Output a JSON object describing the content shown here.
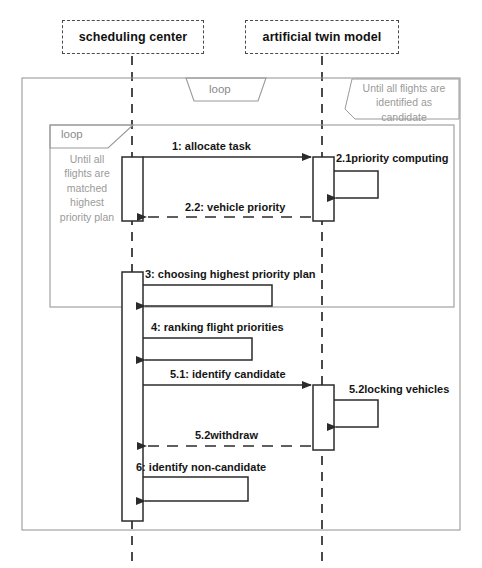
{
  "diagram": {
    "type": "uml-sequence-diagram",
    "title": "",
    "colors": {
      "line": "#3a3a3a",
      "frame": "#9a9a9a",
      "text": "#151515",
      "muted": "#9a9a9a",
      "background": "#ffffff"
    }
  },
  "participants": [
    {
      "id": "scheduling-center",
      "label": "scheduling center",
      "lifeline_x": 132
    },
    {
      "id": "artificial-twin-model",
      "label": "artificial twin model",
      "lifeline_x": 322
    }
  ],
  "fragments": [
    {
      "id": "outer-loop",
      "operator": "loop",
      "guard": "Until all flights are\nidentified as\ncandidate"
    },
    {
      "id": "inner-loop",
      "operator": "loop",
      "guard": "Until all\nflights are\nmatched\nhighest\npriority plan"
    }
  ],
  "messages": [
    {
      "seq": "1",
      "label": "1:  allocate task",
      "kind": "call",
      "from": "scheduling-center",
      "to": "artificial-twin-model"
    },
    {
      "seq": "2.1",
      "label": "2.1priority computing",
      "kind": "self",
      "from": "artificial-twin-model",
      "to": "artificial-twin-model"
    },
    {
      "seq": "2.2",
      "label": "2.2:  vehicle priority",
      "kind": "return",
      "from": "artificial-twin-model",
      "to": "scheduling-center"
    },
    {
      "seq": "3",
      "label": "3:  choosing highest priority plan",
      "kind": "self",
      "from": "scheduling-center",
      "to": "scheduling-center"
    },
    {
      "seq": "4",
      "label": "4:  ranking flight priorities",
      "kind": "self",
      "from": "scheduling-center",
      "to": "scheduling-center"
    },
    {
      "seq": "5.1",
      "label": "5.1:  identify candidate",
      "kind": "call",
      "from": "scheduling-center",
      "to": "artificial-twin-model"
    },
    {
      "seq": "5.2b",
      "label": "5.2locking vehicles",
      "kind": "self",
      "from": "artificial-twin-model",
      "to": "artificial-twin-model"
    },
    {
      "seq": "5.2",
      "label": "5.2withdraw",
      "kind": "return",
      "from": "artificial-twin-model",
      "to": "scheduling-center"
    },
    {
      "seq": "6",
      "label": "6:  identify non-candidate",
      "kind": "self",
      "from": "scheduling-center",
      "to": "scheduling-center"
    }
  ]
}
